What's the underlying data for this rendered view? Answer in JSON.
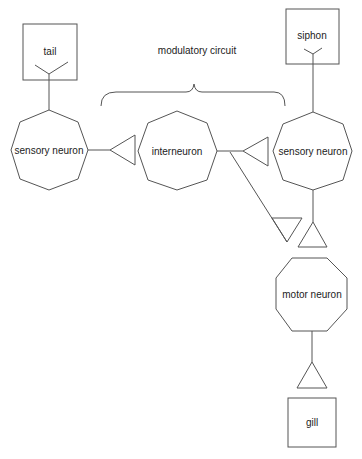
{
  "diagram": {
    "title": "modulatory circuit",
    "nodes": {
      "tail": {
        "label": "tail",
        "type": "receptor-box"
      },
      "siphon": {
        "label": "siphon",
        "type": "receptor-box"
      },
      "sensory_left": {
        "label": "sensory neuron",
        "type": "neuron"
      },
      "interneuron": {
        "label": "interneuron",
        "type": "neuron"
      },
      "sensory_right": {
        "label": "sensory neuron",
        "type": "neuron"
      },
      "motor": {
        "label": "motor neuron",
        "type": "neuron"
      },
      "gill": {
        "label": "gill",
        "type": "effector-box"
      }
    },
    "edges": [
      {
        "from": "tail",
        "to": "sensory_left"
      },
      {
        "from": "sensory_left",
        "to": "interneuron",
        "synapse": "triangle"
      },
      {
        "from": "interneuron",
        "to": "sensory_right",
        "synapse": "triangle"
      },
      {
        "from": "interneuron",
        "to": "motor",
        "synapse": "triangle"
      },
      {
        "from": "siphon",
        "to": "sensory_right"
      },
      {
        "from": "sensory_right",
        "to": "motor",
        "synapse": "triangle"
      },
      {
        "from": "motor",
        "to": "gill",
        "synapse": "triangle"
      }
    ],
    "colors": {
      "stroke": "#555555",
      "text": "#222222",
      "background": "#ffffff"
    }
  }
}
